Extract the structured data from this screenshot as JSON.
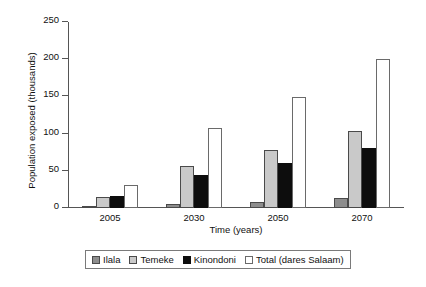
{
  "chart_data": {
    "type": "bar",
    "title": "",
    "xlabel": "Time (years)",
    "ylabel": "Population exposed (thousands)",
    "categories": [
      "2005",
      "2030",
      "2050",
      "2070"
    ],
    "series": [
      {
        "name": "Ilala",
        "color": "#8d8d8d",
        "values": [
          1,
          5,
          8,
          14
        ]
      },
      {
        "name": "Temeke",
        "color": "#c9c9c9",
        "values": [
          15,
          56,
          78,
          104
        ]
      },
      {
        "name": "Kinondoni",
        "color": "#0d0d0d",
        "values": [
          16,
          45,
          61,
          81
        ]
      },
      {
        "name": "Total (dares Salaam)",
        "color": "#ffffff",
        "values": [
          31,
          108,
          149,
          200
        ]
      }
    ],
    "ylim": [
      0,
      250
    ],
    "yticks": [
      0,
      50,
      100,
      150,
      200,
      250
    ],
    "ytick_labels": [
      "0",
      "50",
      "100",
      "150",
      "200",
      "250"
    ],
    "grid": false,
    "legend_position": "bottom"
  },
  "legend": {
    "entries": [
      {
        "label": "Ilala"
      },
      {
        "label": "Temeke"
      },
      {
        "label": "Kinondoni"
      },
      {
        "label": "Total (dares Salaam)"
      }
    ]
  }
}
